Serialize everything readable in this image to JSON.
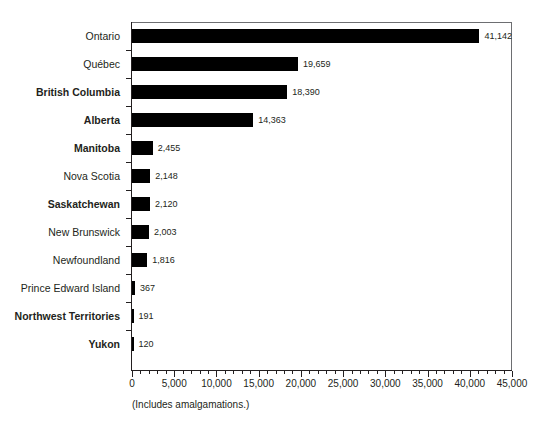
{
  "chart_data": {
    "type": "bar",
    "orientation": "horizontal",
    "title": "",
    "xlabel": "",
    "ylabel": "",
    "xlim": [
      0,
      45000
    ],
    "grid": false,
    "legend": null,
    "caption": "(Includes amalgamations.)",
    "x_tick_labels": [
      "0",
      "5,000",
      "10,000",
      "15,000",
      "20,000",
      "25,000",
      "30,000",
      "35,000",
      "40,000",
      "45,000"
    ],
    "x_tick_values": [
      0,
      5000,
      10000,
      15000,
      20000,
      25000,
      30000,
      35000,
      40000,
      45000
    ],
    "x_minor_tick_step": 1000,
    "bar_color": "#000000",
    "categories": [
      "Ontario",
      "Québec",
      "British Columbia",
      "Alberta",
      "Manitoba",
      "Nova Scotia",
      "Saskatchewan",
      "New Brunswick",
      "Newfoundland",
      "Prince Edward Island",
      "Northwest Territories",
      "Yukon"
    ],
    "values": [
      41142,
      19659,
      18390,
      14363,
      2455,
      2148,
      2120,
      2003,
      1816,
      367,
      191,
      120
    ],
    "value_labels": [
      "41,142",
      "19,659",
      "18,390",
      "14,363",
      "2,455",
      "2,148",
      "2,120",
      "2,003",
      "1,816",
      "367",
      "191",
      "120"
    ],
    "category_bold": [
      false,
      false,
      true,
      true,
      true,
      false,
      true,
      false,
      false,
      false,
      true,
      true
    ]
  }
}
